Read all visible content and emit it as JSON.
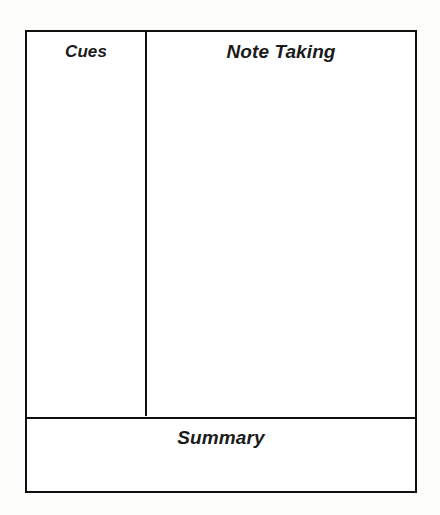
{
  "document": {
    "type": "Cornell Notes Template",
    "background_color": "#fdfdfc",
    "sheet_background_color": "#ffffff",
    "border_color": "#101010",
    "text_color": "#1b1b1b"
  },
  "sections": {
    "cues": {
      "heading": "Cues",
      "body": ""
    },
    "note_taking": {
      "heading": "Note Taking",
      "body": ""
    },
    "summary": {
      "heading": "Summary",
      "body": ""
    }
  }
}
